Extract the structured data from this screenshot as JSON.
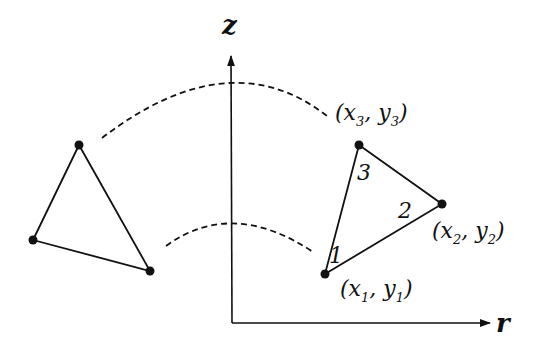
{
  "figure": {
    "colors": {
      "ink": "#111111",
      "background": "#ffffff"
    },
    "axes": {
      "z_label": "z",
      "r_label": "r",
      "origin": [
        232,
        323
      ],
      "z_top": [
        231,
        54
      ],
      "r_right": [
        490,
        323
      ]
    },
    "left_triangle": {
      "vertices": [
        [
          79,
          145
        ],
        [
          33,
          240
        ],
        [
          150,
          271
        ]
      ]
    },
    "right_triangle": {
      "vertices": [
        {
          "id": "1",
          "xy": [
            325,
            274
          ],
          "coord_label": "(x",
          "sub_x": "1",
          "sep": ", y",
          "sub_y": "1",
          "close": ")"
        },
        {
          "id": "2",
          "xy": [
            442,
            204
          ],
          "coord_label": "(x",
          "sub_x": "2",
          "sep": ", y",
          "sub_y": "2",
          "close": ")"
        },
        {
          "id": "3",
          "xy": [
            359,
            145
          ],
          "coord_label": "(x",
          "sub_x": "3",
          "sep": ", y",
          "sub_y": "3",
          "close": ")"
        }
      ],
      "node_numbers": [
        "1",
        "2",
        "3"
      ]
    },
    "arcs": {
      "upper": "M102,138 Q230,40 327,116",
      "lower": "M166,246 Q232,198 313,252"
    }
  }
}
